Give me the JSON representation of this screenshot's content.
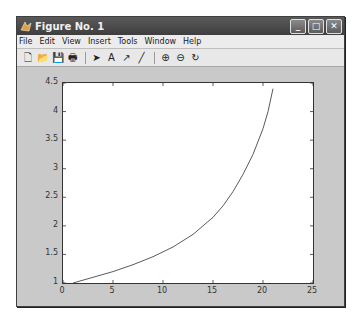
{
  "window": {
    "title": "Figure No. 1",
    "controls": {
      "minimize": "_",
      "maximize": "□",
      "close": "✕"
    }
  },
  "menubar": {
    "items": [
      "File",
      "Edit",
      "View",
      "Insert",
      "Tools",
      "Window",
      "Help"
    ]
  },
  "toolbar": {
    "icons": [
      "new-file-icon",
      "open-folder-icon",
      "save-icon",
      "print-icon",
      "select-arrow-icon",
      "text-icon",
      "arrow-icon",
      "line-icon",
      "zoom-in-icon",
      "zoom-out-icon",
      "rotate-icon"
    ],
    "glyphs": [
      "🗋",
      "📂",
      "💾",
      "🖶",
      "➤",
      "A",
      "↗",
      "╱",
      "⊕",
      "⊖",
      "↻"
    ]
  },
  "colors": {
    "titlebar": "#4a4a4a",
    "figure_bg": "#c9c9c9",
    "axes_bg": "#ffffff",
    "line": "#5a5a5a"
  },
  "chart_data": {
    "type": "line",
    "title": "",
    "xlabel": "",
    "ylabel": "",
    "xlim": [
      0,
      25
    ],
    "ylim": [
      1,
      4.5
    ],
    "x_ticks": [
      "0",
      "5",
      "10",
      "15",
      "20",
      "25"
    ],
    "y_ticks": [
      "1",
      "1.5",
      "2",
      "2.5",
      "3",
      "3.5",
      "4",
      "4.5"
    ],
    "grid": false,
    "legend": null,
    "series": [
      {
        "name": "curve",
        "x": [
          1,
          3,
          5,
          7,
          9,
          11,
          13,
          15,
          16,
          17,
          18,
          19,
          20,
          20.5,
          21
        ],
        "y": [
          1.0,
          1.1,
          1.2,
          1.32,
          1.46,
          1.63,
          1.85,
          2.15,
          2.35,
          2.6,
          2.9,
          3.25,
          3.7,
          4.0,
          4.4
        ]
      }
    ]
  }
}
